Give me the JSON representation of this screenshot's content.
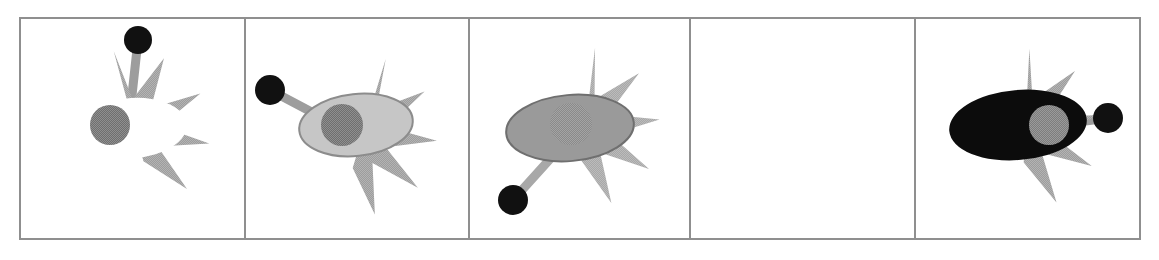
{
  "figure": {
    "type": "image-sequence",
    "panel_count": 5,
    "canvas": {
      "width": 1159,
      "height": 260
    },
    "background_color": "#ffffff",
    "frame": {
      "x": 19,
      "y": 17,
      "width": 1122,
      "height": 223,
      "border_color": "#8f8f8f",
      "border_width": 2,
      "fill": "#ffffff"
    },
    "dividers": {
      "color": "#8f8f8f",
      "width": 2,
      "x_positions": [
        245,
        469,
        690,
        915
      ]
    },
    "palette": {
      "star_gray": "#9d9d9d",
      "star_gray_light": "#a8a8a8",
      "ellipse_white": "#ffffff",
      "ellipse_light_gray": "#c6c6c6",
      "ellipse_mid_gray": "#9a9a9a",
      "ellipse_black": "#0c0c0c",
      "pupil_dark_gray": "#6f6f6f",
      "pupil_black": "#111111",
      "outline_gray": "#6f6f6f",
      "highlight_gray": "#7d7d7d"
    },
    "panels": [
      {
        "index": 1,
        "label": "panel-1",
        "empty": false,
        "star": {
          "cx": 128,
          "cy": 132,
          "outer_radius": 82,
          "inner_radius": 33,
          "rotation_deg": -10,
          "fill": "#9d9d9d"
        },
        "ellipse": {
          "cx": 133,
          "cy": 128,
          "rx": 54,
          "ry": 30,
          "rotation_deg": -4,
          "fill": "#ffffff",
          "stroke": "none"
        },
        "pupil": {
          "cx": 110,
          "cy": 125,
          "r": 20,
          "fill": "#6f6f6f"
        },
        "dot": {
          "cx": 138,
          "cy": 40,
          "r": 14,
          "fill": "#111111",
          "attached_point": "top"
        }
      },
      {
        "index": 2,
        "label": "panel-2",
        "empty": false,
        "star": {
          "cx": 355,
          "cy": 135,
          "outer_radius": 82,
          "inner_radius": 33,
          "rotation_deg": 22,
          "fill": "#9d9d9d"
        },
        "ellipse": {
          "cx": 356,
          "cy": 125,
          "rx": 57,
          "ry": 31,
          "rotation_deg": -6,
          "fill": "#c6c6c6",
          "stroke": "#8c8c8c"
        },
        "pupil": {
          "cx": 342,
          "cy": 125,
          "r": 21,
          "fill": "#6f6f6f"
        },
        "dot": {
          "cx": 270,
          "cy": 90,
          "r": 15,
          "fill": "#111111",
          "attached_point": "upper-left"
        }
      },
      {
        "index": 3,
        "label": "panel-3",
        "empty": false,
        "star": {
          "cx": 578,
          "cy": 128,
          "outer_radius": 82,
          "inner_radius": 33,
          "rotation_deg": 12,
          "fill": "#a8a8a8"
        },
        "ellipse": {
          "cx": 570,
          "cy": 128,
          "rx": 64,
          "ry": 33,
          "rotation_deg": -5,
          "fill": "#9a9a9a",
          "stroke": "#6f6f6f"
        },
        "pupil": {
          "cx": 571,
          "cy": 124,
          "r": 21,
          "fill": "#8a8a8a"
        },
        "dot": {
          "cx": 513,
          "cy": 200,
          "r": 15,
          "fill": "#111111",
          "attached_point": "lower-left"
        }
      },
      {
        "index": 4,
        "label": "panel-4",
        "empty": true,
        "note": "blank frame"
      },
      {
        "index": 5,
        "label": "panel-5",
        "empty": false,
        "star": {
          "cx": 1018,
          "cy": 130,
          "outer_radius": 82,
          "inner_radius": 33,
          "rotation_deg": 8,
          "fill": "#9d9d9d"
        },
        "ellipse": {
          "cx": 1018,
          "cy": 125,
          "rx": 69,
          "ry": 35,
          "rotation_deg": -5,
          "fill": "#0c0c0c",
          "stroke": "none"
        },
        "pupil": {
          "cx": 1049,
          "cy": 125,
          "r": 20,
          "fill": "#7d7d7d"
        },
        "dot": {
          "cx": 1108,
          "cy": 118,
          "r": 15,
          "fill": "#111111",
          "attached_point": "right"
        }
      }
    ]
  }
}
